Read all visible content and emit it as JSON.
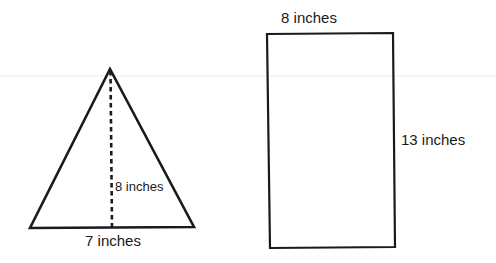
{
  "diagram": {
    "type": "geometry-figures",
    "background": "#ffffff",
    "stroke_color": "#1a1a1a",
    "faint_line_color": "#e8e8e8",
    "shapes": [
      {
        "id": "triangle",
        "kind": "triangle",
        "points": {
          "apex": [
            110,
            69
          ],
          "base_left": [
            30,
            228
          ],
          "base_right": [
            194,
            227
          ]
        },
        "height_line": {
          "style": "dashed",
          "from": [
            110,
            69
          ],
          "to": [
            112,
            228
          ]
        },
        "labels": {
          "height": "8 inches",
          "base": "7 inches"
        }
      },
      {
        "id": "rectangle",
        "kind": "rectangle",
        "box": {
          "x": 267,
          "y": 33,
          "width": 128,
          "height": 215
        },
        "labels": {
          "width": "8 inches",
          "height": "13 inches"
        }
      }
    ]
  }
}
